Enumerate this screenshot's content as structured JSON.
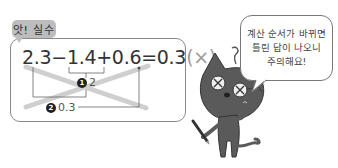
{
  "tag": {
    "label": "앗! 실수"
  },
  "equation": {
    "parts": [
      "2.3",
      "−",
      "1.4",
      "+",
      "0.6",
      "=",
      "0.3"
    ],
    "text": "2.3−1.4+0.6=0.3",
    "verdict": "(×)"
  },
  "steps": [
    {
      "number": "1",
      "value": "2"
    },
    {
      "number": "2",
      "value": "0.3"
    }
  ],
  "speech_bubble": {
    "lines": [
      "계산 순서가 바뀌면",
      "틀린 답이 나오니",
      "주의해요!"
    ]
  },
  "colors": {
    "tag_bg": "#bdbdbd",
    "cross": "#cfcfcf",
    "box_border": "#8a8a8a",
    "cat_body": "#5a5a5a",
    "text": "#333333"
  },
  "icons": {
    "cross_mark": "big-x-icon",
    "character": "cat-character"
  }
}
